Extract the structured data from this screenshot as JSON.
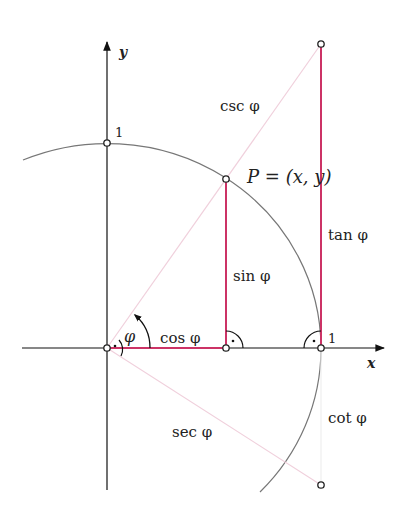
{
  "diagram": {
    "type": "unit-circle-trigonometry",
    "colors": {
      "axis": "#111111",
      "circle": "#777777",
      "primary_segment": "#cc3366",
      "secondary_segment": "#f0d0dc",
      "point_fill": "#ffffff",
      "point_stroke": "#222222"
    },
    "axes": {
      "x_label": "x",
      "y_label": "y",
      "x_tick_label": "1",
      "y_tick_label": "1"
    },
    "point": {
      "label": "P = (x, y)"
    },
    "angle": {
      "label": "φ"
    },
    "segments": {
      "sin": "sin φ",
      "cos": "cos φ",
      "tan": "tan φ",
      "cot": "cot φ",
      "sec": "sec φ",
      "csc": "csc φ"
    }
  }
}
